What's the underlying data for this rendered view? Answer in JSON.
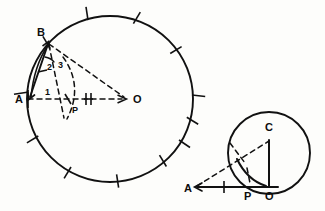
{
  "figure": {
    "background_color": "#fdfdfb",
    "ink_color": "#111111"
  },
  "diagrams": [
    {
      "id": "large-circle-diagram",
      "name": "Circle with center O, diameter A-O, chord A-B and point P",
      "circle": {
        "cx": 110,
        "cy": 99,
        "r": 83,
        "tick_count": 12
      },
      "points": [
        {
          "label": "A",
          "x": 28,
          "y": 99,
          "label_x": 15,
          "label_y": 103
        },
        {
          "label": "B",
          "x": 47,
          "y": 41,
          "label_x": 37,
          "label_y": 36
        },
        {
          "label": "O",
          "x": 126,
          "y": 99,
          "label_x": 133,
          "label_y": 103
        },
        {
          "label": "P",
          "x": 71,
          "y": 99,
          "label_x": 73,
          "label_y": 112
        }
      ],
      "angle_labels": [
        {
          "label": "1",
          "x": 47,
          "y": 93
        },
        {
          "label": "2",
          "x": 50,
          "y": 67
        },
        {
          "label": "3",
          "x": 60,
          "y": 66
        }
      ],
      "congruence_marks": {
        "segment": "P-O",
        "count": 2
      }
    },
    {
      "id": "small-circle-diagram",
      "name": "Circle with center C tangent at O, with secant from A through P",
      "circle": {
        "cx": 269,
        "cy": 153,
        "r": 41
      },
      "points": [
        {
          "label": "A",
          "x": 193,
          "y": 187,
          "label_x": 184,
          "label_y": 191
        },
        {
          "label": "C",
          "x": 269,
          "y": 135,
          "label_x": 266,
          "label_y": 130
        },
        {
          "label": "P",
          "x": 249,
          "y": 187,
          "label_x": 245,
          "label_y": 200
        },
        {
          "label": "O",
          "x": 269,
          "y": 187,
          "label_x": 266,
          "label_y": 200
        }
      ],
      "congruence_marks": {
        "segment": "A-P",
        "count": 1,
        "mark_label": "H"
      }
    }
  ]
}
